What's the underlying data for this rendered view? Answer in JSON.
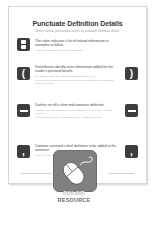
{
  "document": {
    "title": "Punctuate Definition Details",
    "subtitle": "Define various punctuation marks to punctuate definition details",
    "entries": [
      {
        "symbol": ":",
        "symbol_icon": "colon-icon",
        "heading": "The colon indicates a list of related information or examples to follow.",
        "example": "These technologies require reliable hardware."
      },
      {
        "symbol": "(",
        "symbol_right": ")",
        "symbol_icon": "parentheses-icon",
        "heading": "Parentheses identify extra information added for the reader's personal benefit.",
        "example": "The SBC (or Smart Box Controller) manages power levels.",
        "example2": "The PLC (Programmable Logic Controller) uses ladder logic for automated machinery control."
      },
      {
        "symbol": "—",
        "symbol_right": "—",
        "symbol_icon": "dash-icon",
        "heading": "Dashes set off a short mid-sentence definition.",
        "example": "A single board microcontroller—a microcomputer on one board—runs the controller.",
        "example2": "An embedded system—a dedicated device—handles one task."
      },
      {
        "symbol": ",",
        "symbol_right": ",",
        "symbol_icon": "comma-icon",
        "heading": "Commas surround a brief definition to be added to the sentence.",
        "example": "Linux, an open-source OS, powers many devices."
      }
    ]
  },
  "badge": {
    "icon": "mouse-icon",
    "line1": "ONLINE",
    "line2": "RESOURCE"
  }
}
